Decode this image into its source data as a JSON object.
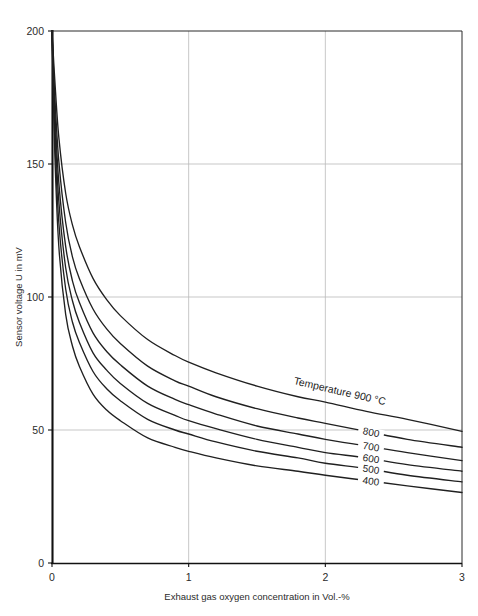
{
  "chart_data": {
    "type": "line",
    "title": "",
    "xlabel": "Exhaust gas oxygen concentration in Vol.-%",
    "ylabel": "Sensor voltage U in mV",
    "xlim": [
      0,
      3
    ],
    "ylim": [
      0,
      200
    ],
    "xticks": [
      "0",
      "1",
      "2",
      "3"
    ],
    "xtick_values": [
      0,
      1,
      2,
      3
    ],
    "yticks": [
      "0",
      "50",
      "100",
      "150",
      "200"
    ],
    "ytick_values": [
      0,
      50,
      100,
      150,
      200
    ],
    "grid": true,
    "legend_position": "inline-curve-labels",
    "series_unit": "°C",
    "series": [
      {
        "name": "900",
        "label": "Temperature 900 °C",
        "x": [
          0.0,
          0.02,
          0.05,
          0.1,
          0.15,
          0.2,
          0.3,
          0.4,
          0.5,
          0.7,
          0.9,
          1.0,
          1.2,
          1.5,
          1.8,
          2.0,
          2.3,
          2.6,
          3.0
        ],
        "y": [
          200,
          182,
          160,
          139,
          127,
          119,
          107,
          99,
          93,
          84,
          78,
          75.5,
          71.5,
          66.5,
          62.5,
          60.5,
          57,
          54,
          49.5
        ]
      },
      {
        "name": "800",
        "label": "800",
        "x": [
          0.0,
          0.02,
          0.05,
          0.1,
          0.15,
          0.2,
          0.3,
          0.4,
          0.5,
          0.7,
          0.9,
          1.0,
          1.2,
          1.5,
          1.8,
          2.0,
          2.3,
          2.6,
          3.0
        ],
        "y": [
          200,
          176,
          151,
          128,
          115,
          107,
          95.5,
          88,
          82.5,
          74,
          68.5,
          66.5,
          62.5,
          58,
          54.5,
          52.5,
          49.5,
          46.5,
          43.5
        ]
      },
      {
        "name": "700",
        "label": "700",
        "x": [
          0.0,
          0.02,
          0.05,
          0.1,
          0.15,
          0.2,
          0.3,
          0.4,
          0.5,
          0.7,
          0.9,
          1.0,
          1.2,
          1.5,
          1.8,
          2.0,
          2.3,
          2.6,
          3.0
        ],
        "y": [
          200,
          171,
          143,
          119,
          106,
          98,
          86.5,
          79.5,
          74.5,
          66.5,
          61.5,
          59.5,
          56,
          51.5,
          48.5,
          46.5,
          44,
          41.5,
          38.5
        ]
      },
      {
        "name": "600",
        "label": "600",
        "x": [
          0.0,
          0.02,
          0.05,
          0.1,
          0.15,
          0.2,
          0.3,
          0.4,
          0.5,
          0.7,
          0.9,
          1.0,
          1.2,
          1.5,
          1.8,
          2.0,
          2.3,
          2.6,
          3.0
        ],
        "y": [
          200,
          166,
          136,
          111,
          98.5,
          90.5,
          79,
          72.5,
          67.5,
          60,
          55.5,
          53.5,
          50.5,
          46.5,
          43.5,
          41.5,
          39.5,
          37,
          34.5
        ]
      },
      {
        "name": "500",
        "label": "500",
        "x": [
          0.0,
          0.02,
          0.05,
          0.1,
          0.15,
          0.2,
          0.3,
          0.4,
          0.5,
          0.7,
          0.9,
          1.0,
          1.2,
          1.5,
          1.8,
          2.0,
          2.3,
          2.6,
          3.0
        ],
        "y": [
          200,
          161,
          128,
          103,
          90.5,
          83,
          72,
          65.5,
          61,
          54,
          50,
          48.5,
          45.5,
          42,
          39.5,
          37.5,
          35.5,
          33,
          30.5
        ]
      },
      {
        "name": "400",
        "label": "400",
        "x": [
          0.0,
          0.02,
          0.05,
          0.1,
          0.15,
          0.2,
          0.3,
          0.4,
          0.5,
          0.7,
          0.9,
          1.0,
          1.2,
          1.5,
          1.8,
          2.0,
          2.3,
          2.6,
          3.0
        ],
        "y": [
          200,
          155,
          119,
          93.5,
          81.5,
          74,
          63.5,
          57.5,
          53.5,
          47,
          43.5,
          42,
          39.5,
          36.5,
          34.5,
          33,
          31,
          29,
          26.5
        ]
      }
    ],
    "colors": {
      "curve": "#202020",
      "grid": "#b9b9b9",
      "axis": "#111111",
      "background": "#ffffff"
    }
  }
}
